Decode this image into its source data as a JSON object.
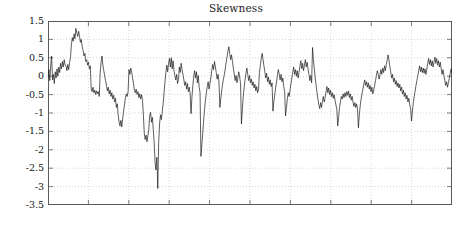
{
  "chart_data": {
    "type": "line",
    "title": "Skewness",
    "xlabel": "",
    "ylabel": "",
    "ylim": [
      -3.5,
      1.5
    ],
    "xlim": [
      0,
      420
    ],
    "yticks": [
      1.5,
      1,
      0.5,
      0,
      -0.5,
      -1,
      -1.5,
      -2,
      -2.5,
      -3,
      -3.5
    ],
    "ytick_labels": [
      "1.5",
      "1",
      "0.5",
      "0",
      "-0.5",
      "-1",
      "-1.5",
      "-2",
      "-2.5",
      "-3",
      "-3.5"
    ],
    "xticks": [
      0,
      42,
      84,
      126,
      168,
      210,
      252,
      294,
      336,
      378,
      420
    ],
    "xtick_labels": [
      "",
      "",
      "",
      "",
      "",
      "",
      "",
      "",
      "",
      "",
      ""
    ],
    "grid": true,
    "grid_style": "dotted",
    "legend": "none",
    "line_color": "#1a1a1a",
    "line_width": 0.7,
    "background": "#ffffff",
    "axis_color": "#555555",
    "series": [
      {
        "name": "Skewness",
        "values": [
          -0.05,
          0.18,
          -0.12,
          0.3,
          0.55,
          -0.1,
          0.05,
          -0.2,
          0.12,
          -0.05,
          0.2,
          0.0,
          0.25,
          0.1,
          0.35,
          0.2,
          0.4,
          0.25,
          0.45,
          0.3,
          0.28,
          0.15,
          0.32,
          0.18,
          0.38,
          0.5,
          0.85,
          1.05,
          0.95,
          1.15,
          1.02,
          1.3,
          1.18,
          1.08,
          1.22,
          1.1,
          0.92,
          1.0,
          0.8,
          0.7,
          0.55,
          0.62,
          0.4,
          0.45,
          0.3,
          0.38,
          0.2,
          0.28,
          -0.35,
          -0.42,
          -0.3,
          -0.45,
          -0.38,
          -0.5,
          -0.4,
          -0.48,
          -0.42,
          -0.55,
          0.1,
          0.38,
          0.55,
          0.3,
          0.15,
          0.0,
          -0.12,
          -0.25,
          -0.4,
          -0.3,
          -0.48,
          -0.38,
          -0.55,
          -0.45,
          -0.62,
          -0.52,
          -0.7,
          -0.6,
          -0.85,
          -0.75,
          -1.05,
          -1.25,
          -1.35,
          -1.2,
          -1.38,
          -1.15,
          -0.95,
          -0.78,
          -0.6,
          -0.48,
          -0.55,
          -0.42,
          0.18,
          0.05,
          0.22,
          0.12,
          -0.05,
          -0.2,
          -0.38,
          -0.45,
          -0.35,
          -0.5,
          -0.42,
          -0.58,
          -0.48,
          -0.62,
          -0.5,
          -0.65,
          -1.05,
          -1.55,
          -1.72,
          -1.6,
          -1.78,
          -1.62,
          -1.45,
          -1.08,
          -0.98,
          -1.25,
          -1.12,
          -1.45,
          -1.8,
          -2.35,
          -2.55,
          -2.2,
          -3.05,
          -1.8,
          -1.3,
          -1.05,
          -1.18,
          -0.95,
          -0.75,
          -0.45,
          -0.15,
          0.1,
          0.3,
          0.12,
          0.35,
          0.48,
          0.25,
          0.5,
          0.2,
          0.42,
          0.15,
          0.02,
          -0.1,
          0.05,
          -0.2,
          -0.08,
          0.25,
          0.1,
          0.35,
          0.18,
          0.05,
          -0.1,
          -0.25,
          -0.15,
          -0.35,
          -0.2,
          -0.42,
          -0.3,
          -0.48,
          -1.02,
          -0.55,
          -0.25,
          0.0,
          0.15,
          -0.05,
          0.12,
          -0.18,
          0.02,
          -0.3,
          -0.45,
          -2.18,
          -1.85,
          -1.55,
          -1.2,
          -0.9,
          -0.65,
          -0.45,
          -0.28,
          -0.15,
          -0.35,
          -0.2,
          -0.05,
          0.15,
          0.32,
          0.18,
          0.4,
          0.25,
          0.1,
          -0.08,
          0.05,
          -0.15,
          -0.85,
          -0.62,
          -0.4,
          -0.22,
          -0.08,
          0.05,
          0.2,
          0.38,
          0.52,
          0.68,
          0.8,
          0.62,
          0.45,
          0.58,
          0.4,
          0.22,
          0.05,
          -0.12,
          0.02,
          -0.18,
          -0.05,
          0.12,
          -0.02,
          -0.2,
          -1.3,
          -0.9,
          -0.55,
          -0.3,
          -0.1,
          0.08,
          0.22,
          0.05,
          -0.12,
          0.02,
          -0.18,
          -0.08,
          -0.25,
          -0.15,
          -0.32,
          -0.22,
          -0.4,
          -0.28,
          -0.45,
          -0.35,
          0.1,
          0.3,
          0.48,
          0.62,
          0.45,
          0.28,
          0.12,
          -0.05,
          0.08,
          -0.15,
          -0.02,
          -0.22,
          -0.1,
          -0.28,
          -0.18,
          -0.95,
          -0.7,
          -0.5,
          -0.32,
          -0.15,
          0.02,
          0.18,
          0.05,
          -0.1,
          0.05,
          -0.15,
          -0.05,
          -0.28,
          -0.42,
          -1.08,
          -0.85,
          -0.62,
          -0.45,
          -0.55,
          -0.38,
          -0.2,
          -0.05,
          0.1,
          0.25,
          0.05,
          0.18,
          0.0,
          0.15,
          -0.05,
          0.1,
          0.28,
          0.42,
          0.2,
          0.35,
          0.15,
          0.3,
          0.45,
          0.25,
          0.38,
          0.2,
          0.05,
          -0.12,
          0.02,
          -0.18,
          0.78,
          0.45,
          0.2,
          -0.05,
          -0.25,
          -0.45,
          -0.62,
          -0.78,
          -0.88,
          -0.72,
          -0.85,
          -0.68,
          -0.55,
          -0.7,
          -0.58,
          -0.42,
          -0.28,
          -0.45,
          -0.32,
          -0.5,
          -0.38,
          -0.55,
          -0.45,
          -0.6,
          -0.5,
          -0.65,
          -0.78,
          -0.9,
          -1.35,
          -1.1,
          -0.85,
          -0.7,
          -0.55,
          -0.62,
          -0.48,
          -0.58,
          -0.45,
          -0.55,
          -0.42,
          -0.52,
          -0.4,
          -0.58,
          -0.48,
          -0.65,
          -0.55,
          -0.7,
          -0.82,
          -0.72,
          -0.85,
          -0.75,
          -0.9,
          -1.4,
          -1.05,
          -0.8,
          -0.62,
          -0.48,
          -0.35,
          -0.22,
          -0.1,
          -0.25,
          -0.15,
          -0.3,
          -0.18,
          -0.35,
          -0.25,
          -0.42,
          -0.3,
          -0.48,
          -0.38,
          -0.25,
          -0.12,
          0.02,
          0.15,
          0.05,
          -0.08,
          0.05,
          0.18,
          0.05,
          0.22,
          0.1,
          0.28,
          0.15,
          0.32,
          0.45,
          0.58,
          0.42,
          0.25,
          0.1,
          -0.05,
          0.05,
          -0.15,
          -0.05,
          -0.22,
          -0.12,
          -0.28,
          -0.18,
          -0.32,
          -0.22,
          -0.4,
          -0.3,
          -0.48,
          -0.38,
          -0.55,
          -0.45,
          -0.62,
          -0.52,
          -0.7,
          -0.6,
          -0.78,
          -0.88,
          -1.22,
          -0.95,
          -0.72,
          -0.55,
          -0.4,
          -0.25,
          -0.12,
          0.02,
          0.15,
          0.28,
          0.12,
          0.25,
          0.1,
          0.22,
          0.08,
          0.2,
          0.05,
          0.18,
          0.35,
          0.48,
          0.32,
          0.45,
          0.28,
          0.42,
          0.25,
          0.38,
          0.52,
          0.35,
          0.48,
          0.3,
          0.42,
          0.25,
          0.38,
          0.2,
          0.05,
          0.18,
          0.02,
          -0.12,
          -0.25,
          -0.15,
          -0.3,
          -0.18,
          -0.05,
          0.08,
          0.2,
          0.1
        ]
      }
    ]
  }
}
